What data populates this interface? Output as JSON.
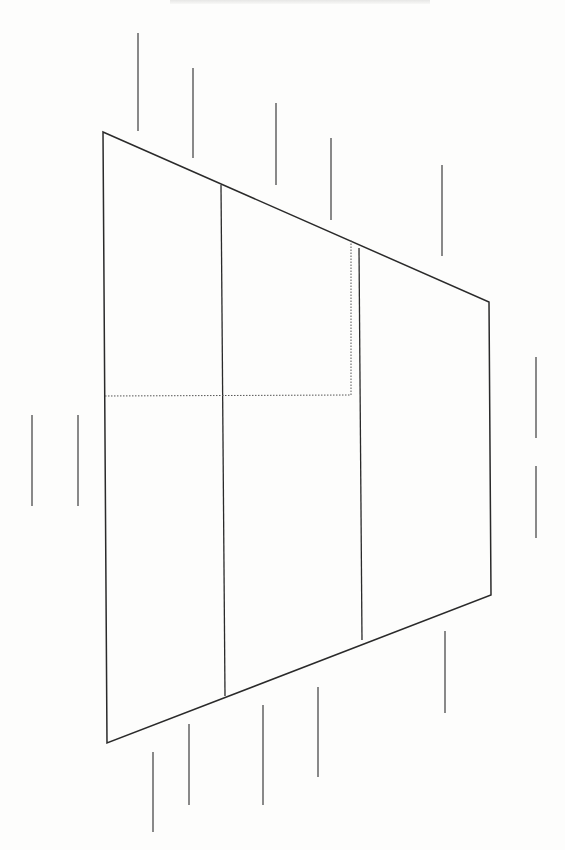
{
  "figure": {
    "type": "line-drawing",
    "stroke_color": "#2a2a2a",
    "dotted_color": "#555555",
    "background": "#fdfdfc"
  },
  "shape": {
    "outline": {
      "points": [
        [
          103,
          132
        ],
        [
          489,
          302
        ],
        [
          491,
          595
        ],
        [
          107,
          743
        ]
      ]
    },
    "dividers": [
      {
        "x1": 221,
        "y1": 185,
        "x2": 225,
        "y2": 696
      },
      {
        "x1": 359,
        "y1": 248,
        "x2": 362,
        "y2": 640
      }
    ],
    "dotted_path": {
      "points": [
        [
          105,
          396
        ],
        [
          351,
          395
        ],
        [
          351,
          240
        ]
      ]
    }
  },
  "ticks": {
    "top": [
      {
        "x1": 138,
        "y1": 33,
        "x2": 138,
        "y2": 131
      },
      {
        "x1": 193,
        "y1": 68,
        "x2": 193,
        "y2": 158
      },
      {
        "x1": 276,
        "y1": 103,
        "x2": 276,
        "y2": 185
      },
      {
        "x1": 331,
        "y1": 138,
        "x2": 331,
        "y2": 220
      },
      {
        "x1": 442,
        "y1": 165,
        "x2": 442,
        "y2": 256
      }
    ],
    "bottom": [
      {
        "x1": 153,
        "y1": 752,
        "x2": 153,
        "y2": 832
      },
      {
        "x1": 189,
        "y1": 724,
        "x2": 189,
        "y2": 805
      },
      {
        "x1": 263,
        "y1": 705,
        "x2": 263,
        "y2": 805
      },
      {
        "x1": 318,
        "y1": 687,
        "x2": 318,
        "y2": 777
      },
      {
        "x1": 445,
        "y1": 631,
        "x2": 445,
        "y2": 713
      }
    ],
    "left": [
      {
        "x1": 32,
        "y1": 415,
        "x2": 32,
        "y2": 506
      },
      {
        "x1": 78,
        "y1": 415,
        "x2": 78,
        "y2": 506
      }
    ],
    "right": [
      {
        "x1": 536,
        "y1": 357,
        "x2": 536,
        "y2": 438
      },
      {
        "x1": 536,
        "y1": 466,
        "x2": 536,
        "y2": 538
      }
    ]
  }
}
